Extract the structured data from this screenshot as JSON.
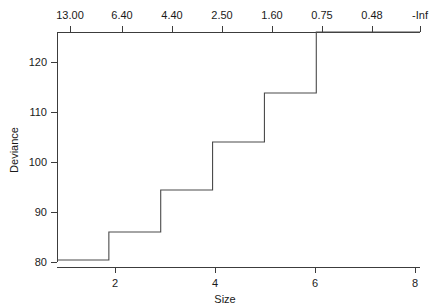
{
  "chart_data": {
    "type": "line",
    "subtype": "step",
    "title": "",
    "xlabel": "Size",
    "ylabel": "Deviance",
    "xlim": [
      1,
      8
    ],
    "ylim": [
      78.5,
      127.5
    ],
    "grid": false,
    "legend": null,
    "x": [
      1,
      2,
      3,
      4,
      5,
      6,
      7,
      8
    ],
    "values": [
      80.4,
      86.0,
      94.4,
      104.0,
      113.8,
      126.0,
      126.0,
      126.0
    ],
    "steps": [
      {
        "x_start": 1,
        "x_end": 2,
        "y": 80.4
      },
      {
        "x_start": 2,
        "x_end": 3,
        "y": 86.0
      },
      {
        "x_start": 3,
        "x_end": 4,
        "y": 94.4
      },
      {
        "x_start": 4,
        "x_end": 5,
        "y": 104.0
      },
      {
        "x_start": 5,
        "x_end": 6,
        "y": 113.8
      },
      {
        "x_start": 6,
        "x_end": 8,
        "y": 126.0
      }
    ],
    "x_axis": {
      "position": "bottom",
      "label": "Size",
      "ticks": [
        2,
        4,
        6,
        8
      ],
      "tick_labels": [
        "2",
        "4",
        "6",
        "8"
      ]
    },
    "y_axis": {
      "position": "left",
      "label": "Deviance",
      "ticks": [
        80,
        90,
        100,
        110,
        120
      ],
      "tick_labels": [
        "80",
        "90",
        "100",
        "110",
        "120"
      ]
    },
    "top_axis": {
      "position": "top",
      "label": "",
      "tick_labels": [
        "13.00",
        "6.40",
        "4.40",
        "2.50",
        "1.60",
        "0.75",
        "0.48",
        "-Inf"
      ],
      "tick_x": [
        1.16,
        1.58,
        2.18,
        2.68,
        3.18,
        3.68,
        4.18,
        4.66
      ]
    },
    "colors": {
      "line": "#4a4a4a",
      "axis": "#3c3c3c",
      "text": "#1a1a1a",
      "background": "#ffffff"
    }
  }
}
